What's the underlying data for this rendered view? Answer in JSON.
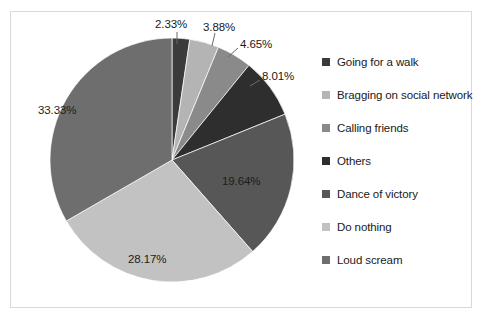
{
  "chart_data": {
    "type": "pie",
    "title": "",
    "subtitle": "",
    "xlabel": "",
    "ylabel": "",
    "grid": false,
    "legend_position": "right",
    "categories": [
      "Going for a walk",
      "Bragging on social network",
      "Calling friends",
      "Others",
      "Dance of victory",
      "Do nothing",
      "Loud scream"
    ],
    "values": [
      2.33,
      3.88,
      4.65,
      8.01,
      19.64,
      28.17,
      33.33
    ],
    "value_unit": "%",
    "data_labels": [
      "2.33%",
      "3.88%",
      "4.65%",
      "8.01%",
      "19.64%",
      "28.17%",
      "33.33%"
    ],
    "slice_colors": [
      "#3b3b3b",
      "#b4b4b4",
      "#8a8a8a",
      "#2e2e2e",
      "#575757",
      "#c2c2c2",
      "#6e6e6e"
    ],
    "start_angle_deg": 0,
    "direction": "clockwise"
  },
  "legend": {
    "items": [
      {
        "label": "Going for a walk",
        "color": "#3b3b3b"
      },
      {
        "label": "Bragging on social network",
        "color": "#b4b4b4"
      },
      {
        "label": "Calling friends",
        "color": "#8a8a8a"
      },
      {
        "label": "Others",
        "color": "#2e2e2e"
      },
      {
        "label": "Dance of victory",
        "color": "#575757"
      },
      {
        "label": "Do nothing",
        "color": "#c2c2c2"
      },
      {
        "label": "Loud scream",
        "color": "#6e6e6e"
      }
    ]
  },
  "labels": {
    "outside": [
      {
        "text": "2.33%",
        "left": 155,
        "top": 18
      },
      {
        "text": "3.88%",
        "left": 203,
        "top": 21
      },
      {
        "text": "4.65%",
        "left": 240,
        "top": 38
      },
      {
        "text": "8.01%",
        "left": 262,
        "top": 70
      }
    ],
    "inside": [
      {
        "text": "19.64%",
        "left": 222,
        "top": 175
      },
      {
        "text": "28.17%",
        "left": 128,
        "top": 253
      },
      {
        "text": "33.33%",
        "left": 38,
        "top": 104
      }
    ]
  },
  "geometry": {
    "center_x": 172,
    "center_y": 160,
    "radius": 122
  }
}
